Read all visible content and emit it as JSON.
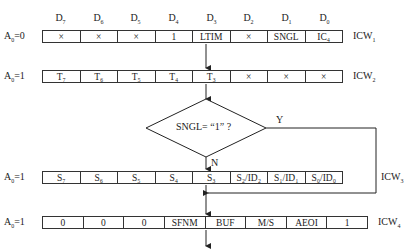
{
  "bit_headers": [
    {
      "base": "D",
      "sub": "7"
    },
    {
      "base": "D",
      "sub": "6"
    },
    {
      "base": "D",
      "sub": "5"
    },
    {
      "base": "D",
      "sub": "4"
    },
    {
      "base": "D",
      "sub": "3"
    },
    {
      "base": "D",
      "sub": "2"
    },
    {
      "base": "D",
      "sub": "1"
    },
    {
      "base": "D",
      "sub": "0"
    }
  ],
  "rows": [
    {
      "address": {
        "base": "A",
        "sub": "0",
        "value": "=0"
      },
      "name": {
        "base": "ICW",
        "sub": "1"
      },
      "cells": [
        "×",
        "×",
        "×",
        "1",
        "LTIM",
        "×",
        "SNGL",
        "IC₄"
      ]
    },
    {
      "address": {
        "base": "A",
        "sub": "0",
        "value": "=1"
      },
      "name": {
        "base": "ICW",
        "sub": "2"
      },
      "cells": [
        "T₇",
        "T₆",
        "T₅",
        "T₄",
        "T₃",
        "×",
        "×",
        "×"
      ]
    },
    {
      "address": {
        "base": "A",
        "sub": "0",
        "value": "=1"
      },
      "name": {
        "base": "ICW",
        "sub": "3"
      },
      "cells": [
        "S₇",
        "S₆",
        "S₅",
        "S₄",
        "S₃",
        "S₂/ID₂",
        "S₁/ID₁",
        "S₀/ID₀"
      ]
    },
    {
      "address": {
        "base": "A",
        "sub": "0",
        "value": "=1"
      },
      "name": {
        "base": "ICW",
        "sub": "4"
      },
      "cells": [
        "0",
        "0",
        "0",
        "SFNM",
        "BUF",
        "M/S",
        "AEOI",
        "1"
      ]
    }
  ],
  "decision": {
    "text": "SNGL= “1” ?",
    "yes_label": "Y",
    "no_label": "N"
  }
}
